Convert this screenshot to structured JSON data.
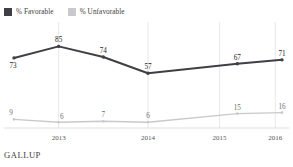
{
  "legend": {
    "items": [
      {
        "label": "% Favorable",
        "color": "#3f3f45",
        "key": "favorable"
      },
      {
        "label": "% Unfavorable",
        "color": "#c9c9cd",
        "key": "unfavorable"
      }
    ]
  },
  "footer": {
    "brand": "GALLUP"
  },
  "chart_data": {
    "type": "line",
    "title": "",
    "subtitle": "",
    "xlabel": "",
    "ylabel": "",
    "grid": "vertical",
    "legend_position": "top-left",
    "ylim": [
      0,
      100
    ],
    "xlim": [
      0,
      6
    ],
    "x": [
      0,
      1,
      2,
      3,
      4,
      5,
      6
    ],
    "tick_labels": [
      "2013",
      "2014",
      "2015",
      "2016"
    ],
    "tick_x": [
      1,
      3,
      4.6,
      5.85
    ],
    "series": [
      {
        "name": "% Favorable",
        "color": "#3f3f45",
        "values": [
          73,
          85,
          74,
          57,
          null,
          67,
          71
        ],
        "labels": [
          "73",
          "85",
          "74",
          "57",
          "",
          "67",
          "71"
        ]
      },
      {
        "name": "% Unfavorable",
        "color": "#c9c9cd",
        "values": [
          9,
          6,
          7,
          6,
          null,
          15,
          16
        ],
        "labels": [
          "9",
          "6",
          "7",
          "6",
          "",
          "15",
          "16"
        ]
      }
    ]
  }
}
